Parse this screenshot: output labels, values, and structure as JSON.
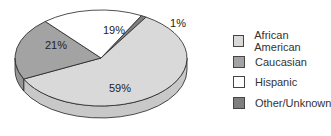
{
  "chart_data": {
    "type": "pie",
    "title": "",
    "categories": [
      "African American",
      "Caucasian",
      "Hispanic",
      "Other/Unknown"
    ],
    "values": [
      59,
      21,
      19,
      1
    ],
    "labels": [
      "59%",
      "21%",
      "19%",
      "1%"
    ],
    "colors": [
      "#d9d9d9",
      "#a3a3a3",
      "#ffffff",
      "#7f7f7f"
    ],
    "style": "3d-tilted",
    "legend_position": "right"
  },
  "legend": [
    {
      "label": "African American",
      "color": "#d9d9d9"
    },
    {
      "label": "Caucasian",
      "color": "#a3a3a3"
    },
    {
      "label": "Hispanic",
      "color": "#ffffff"
    },
    {
      "label": "Other/Unknown",
      "color": "#7f7f7f"
    }
  ]
}
